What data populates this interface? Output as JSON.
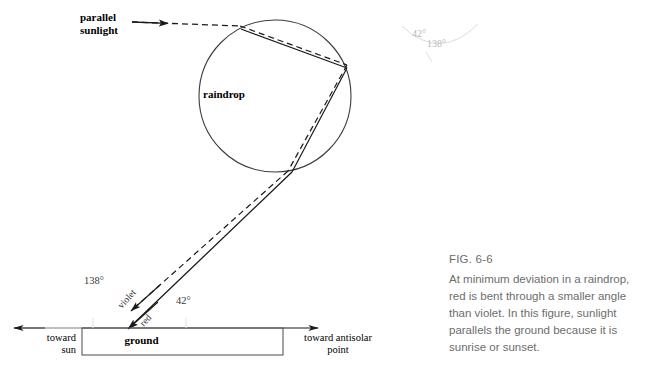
{
  "figure": {
    "labels": {
      "parallel_sunlight_line1": "parallel",
      "parallel_sunlight_line2": "sunlight",
      "raindrop": "raindrop",
      "ground": "ground",
      "toward_sun_line1": "toward",
      "toward_sun_line2": "sun",
      "toward_antisolar_line1": "toward antisolar",
      "toward_antisolar_line2": "point",
      "violet_ray": "violet",
      "red_ray": "red"
    },
    "angles": {
      "ground_left": "138°",
      "ground_right": "42°",
      "faint_upper": "42°",
      "faint_lower": "138°"
    },
    "colors": {
      "stroke": "#1a1a1a",
      "circle": "#3d3d3d",
      "faint": "#bcbcbc",
      "caption": "#6d6d6d",
      "ground_box": "#4a4a4a"
    }
  },
  "caption": {
    "fig_number": "FIG. 6-6",
    "body": "At minimum deviation in a raindrop, red is bent through a smaller angle than violet. In this figure, sunlight parallels the ground because it is sunrise or sunset."
  }
}
